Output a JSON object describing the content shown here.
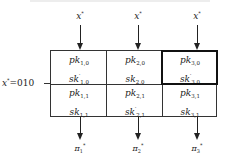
{
  "diagram": {
    "inputs": [
      {
        "label": "x",
        "mark": "*"
      },
      {
        "label": "x",
        "mark": "*"
      },
      {
        "label": "x",
        "mark": "*"
      }
    ],
    "row_label": {
      "var": "x",
      "mark": "*",
      "value": "=010"
    },
    "cells": [
      [
        {
          "pk": "pk",
          "pk_sub": "1,0",
          "sk": "sk",
          "sk_prime": "′",
          "sk_sub": "1,0"
        },
        {
          "pk": "pk",
          "pk_sub": "2,0",
          "sk": "sk",
          "sk_prime": "",
          "sk_sub": "2,0"
        },
        {
          "pk": "pk",
          "pk_sub": "3,0",
          "sk": "sk",
          "sk_prime": "′",
          "sk_sub": "3,0",
          "highlighted": true
        }
      ],
      [
        {
          "pk": "pk",
          "pk_sub": "1,1",
          "sk": "sk",
          "sk_prime": "",
          "sk_sub": "1,1"
        },
        {
          "pk": "pk",
          "pk_sub": "2,1",
          "sk": "sk",
          "sk_prime": "′",
          "sk_sub": "2,1"
        },
        {
          "pk": "pk",
          "pk_sub": "3,1",
          "sk": "sk",
          "sk_prime": "",
          "sk_sub": "3,1"
        }
      ]
    ],
    "outputs": [
      {
        "label": "π",
        "sub": "1",
        "mark": "*"
      },
      {
        "label": "π",
        "sub": "2",
        "mark": "*"
      },
      {
        "label": "π",
        "sub": "3",
        "mark": "*"
      }
    ]
  }
}
